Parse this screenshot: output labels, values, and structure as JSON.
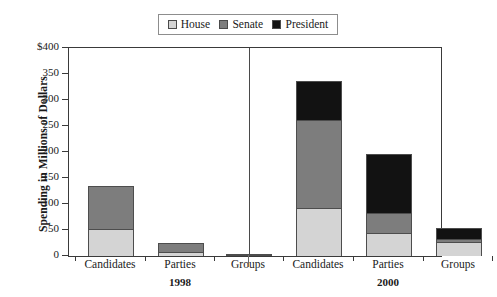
{
  "chart_data": {
    "type": "bar",
    "subtype": "stacked-grouped",
    "title": "",
    "xlabel": "",
    "ylabel": "Spending in Millions of Dollars",
    "ylim": [
      0,
      400
    ],
    "ytick_labels": [
      "$400",
      "350",
      "300",
      "250",
      "200",
      "150",
      "100",
      "50",
      "0"
    ],
    "ytick_values": [
      400,
      350,
      300,
      250,
      200,
      150,
      100,
      50,
      0
    ],
    "grid": false,
    "legend_position": "top-center",
    "legend": [
      "House",
      "Senate",
      "President"
    ],
    "categories": [
      "Candidates",
      "Parties",
      "Groups",
      "Candidates",
      "Parties",
      "Groups"
    ],
    "groups": [
      {
        "label": "1998",
        "categories": [
          "Candidates",
          "Parties",
          "Groups"
        ]
      },
      {
        "label": "2000",
        "categories": [
          "Candidates",
          "Parties",
          "Groups"
        ]
      }
    ],
    "series": [
      {
        "name": "House",
        "color": "#d4d4d4",
        "values": [
          52,
          7,
          2,
          93,
          45,
          26
        ]
      },
      {
        "name": "Senate",
        "color": "#7d7d7d",
        "values": [
          83,
          18,
          1,
          169,
          38,
          7
        ]
      },
      {
        "name": "President",
        "color": "#121212",
        "values": [
          0,
          0,
          0,
          75,
          114,
          20
        ]
      }
    ],
    "totals": [
      135,
      25,
      3,
      337,
      197,
      53
    ],
    "bars": [
      {
        "group": "1998",
        "category": "Candidates",
        "house": 52,
        "senate": 83,
        "president": 0,
        "total": 135
      },
      {
        "group": "1998",
        "category": "Parties",
        "house": 7,
        "senate": 18,
        "president": 0,
        "total": 25
      },
      {
        "group": "1998",
        "category": "Groups",
        "house": 2,
        "senate": 1,
        "president": 0,
        "total": 3
      },
      {
        "group": "2000",
        "category": "Candidates",
        "house": 93,
        "senate": 169,
        "president": 75,
        "total": 337
      },
      {
        "group": "2000",
        "category": "Parties",
        "house": 45,
        "senate": 38,
        "president": 114,
        "total": 197
      },
      {
        "group": "2000",
        "category": "Groups",
        "house": 26,
        "senate": 7,
        "president": 20,
        "total": 53
      }
    ]
  },
  "legend": {
    "items": [
      {
        "label": "House",
        "color": "#d4d4d4"
      },
      {
        "label": "Senate",
        "color": "#7d7d7d"
      },
      {
        "label": "President",
        "color": "#121212"
      }
    ]
  },
  "axes": {
    "y_title": "Spending in Millions of Dollars",
    "y_ticks": [
      "$400",
      "350",
      "300",
      "250",
      "200",
      "150",
      "100",
      "50",
      "0"
    ],
    "x_categories": [
      "Candidates",
      "Parties",
      "Groups",
      "Candidates",
      "Parties",
      "Groups"
    ],
    "x_groups": [
      "1998",
      "2000"
    ]
  },
  "colors": {
    "house": "#d4d4d4",
    "senate": "#7d7d7d",
    "president": "#121212",
    "axis": "#3a3a3a",
    "background": "#ffffff"
  }
}
